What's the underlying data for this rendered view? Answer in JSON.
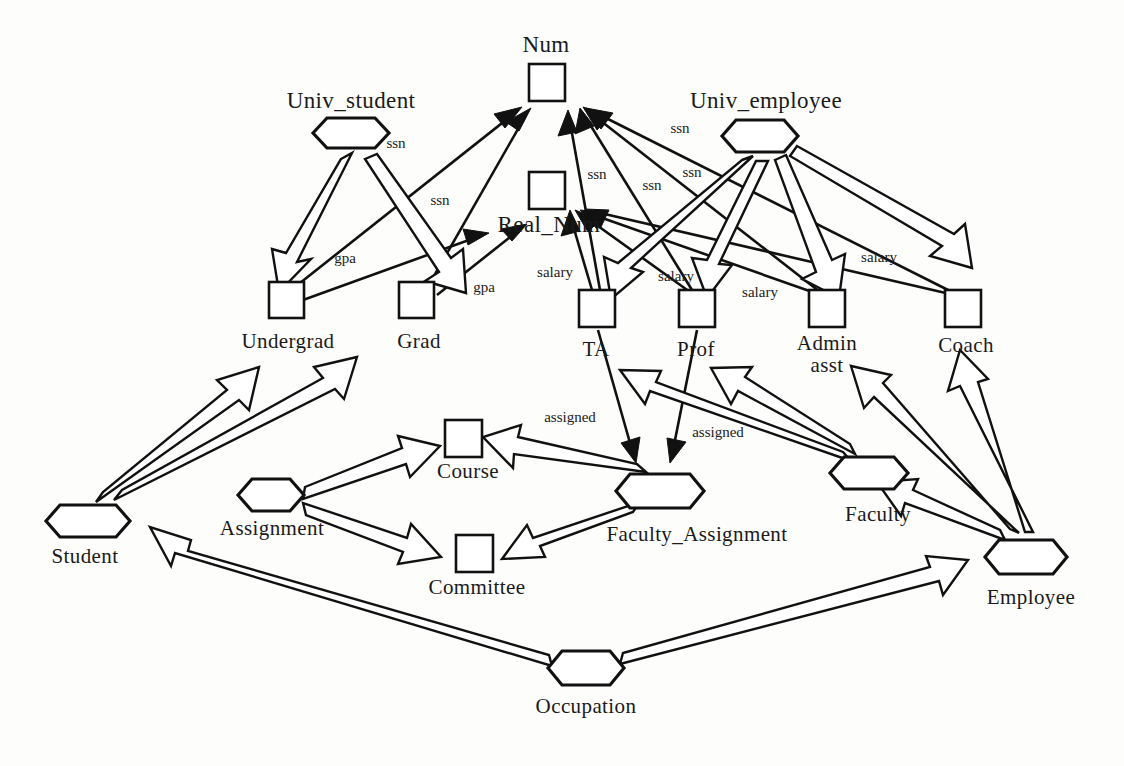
{
  "diagram": {
    "type": "entity-relationship",
    "stroke_color": "#111111",
    "background_color": "#fdfdfc"
  },
  "nodes": {
    "num": {
      "label": "Num",
      "shape": "box",
      "x": 546,
      "y": 83,
      "label_x": 546,
      "label_y": 52
    },
    "real_num": {
      "label": "Real_Num",
      "shape": "box",
      "x": 546,
      "y": 191,
      "label_x": 549,
      "label_y": 232
    },
    "univ_student": {
      "label": "Univ_student",
      "shape": "hexagon",
      "x": 351,
      "y": 133,
      "label_x": 351,
      "label_y": 108
    },
    "univ_employee": {
      "label": "Univ_employee",
      "shape": "hexagon",
      "x": 760,
      "y": 135,
      "label_x": 766,
      "label_y": 108
    },
    "undergrad": {
      "label": "Undergrad",
      "shape": "box",
      "x": 286,
      "y": 299,
      "label_x": 288,
      "label_y": 348
    },
    "grad": {
      "label": "Grad",
      "shape": "box",
      "x": 416,
      "y": 299,
      "label_x": 419,
      "label_y": 348
    },
    "ta": {
      "label": "TA",
      "shape": "box",
      "x": 597,
      "y": 308,
      "label_x": 596,
      "label_y": 356
    },
    "prof": {
      "label": "Prof",
      "shape": "box",
      "x": 697,
      "y": 308,
      "label_x": 696,
      "label_y": 356
    },
    "admin_asst": {
      "label": "Admin",
      "label2": "asst",
      "shape": "box",
      "x": 827,
      "y": 308,
      "label_x": 827,
      "label_y": 350,
      "label2_x": 827,
      "label2_y": 371
    },
    "coach": {
      "label": "Coach",
      "shape": "box",
      "x": 963,
      "y": 308,
      "label_x": 966,
      "label_y": 352
    },
    "student": {
      "label": "Student",
      "shape": "hexagon",
      "x": 88,
      "y": 521,
      "label_x": 85,
      "label_y": 563
    },
    "assignment": {
      "label": "Assignment",
      "shape": "hexagon",
      "x": 275,
      "y": 495,
      "label_x": 272,
      "label_y": 535
    },
    "course": {
      "label": "Course",
      "shape": "box",
      "x": 463,
      "y": 438,
      "label_x": 468,
      "label_y": 478
    },
    "committee": {
      "label": "Committee",
      "shape": "box",
      "x": 474,
      "y": 553,
      "label_x": 477,
      "label_y": 594
    },
    "faculty_assignment": {
      "label": "Faculty_Assignment",
      "shape": "hexagon",
      "x": 660,
      "y": 491,
      "label_x": 697,
      "label_y": 541
    },
    "faculty": {
      "label": "Faculty",
      "shape": "hexagon",
      "x": 869,
      "y": 473,
      "label_x": 878,
      "label_y": 521
    },
    "employee": {
      "label": "Employee",
      "shape": "hexagon",
      "x": 1026,
      "y": 557,
      "label_x": 1031,
      "label_y": 604
    },
    "occupation": {
      "label": "Occupation",
      "shape": "hexagon",
      "x": 586,
      "y": 668,
      "label_x": 586,
      "label_y": 713
    }
  },
  "edge_labels": [
    {
      "id": "ssn-undergrad",
      "text": "ssn",
      "x": 396,
      "y": 148
    },
    {
      "id": "ssn-grad",
      "text": "ssn",
      "x": 440,
      "y": 205
    },
    {
      "id": "ssn-ta",
      "text": "ssn",
      "x": 597,
      "y": 179
    },
    {
      "id": "ssn-prof",
      "text": "ssn",
      "x": 650,
      "y": 189
    },
    {
      "id": "ssn-admin",
      "text": "ssn",
      "x": 690,
      "y": 177
    },
    {
      "id": "ssn-coach",
      "text": "ssn",
      "x": 678,
      "y": 133
    },
    {
      "id": "gpa-undergrad",
      "text": "gpa",
      "x": 345,
      "y": 263
    },
    {
      "id": "gpa-grad",
      "text": "gpa",
      "x": 484,
      "y": 292
    },
    {
      "id": "salary-ta",
      "text": "salary",
      "x": 555,
      "y": 277
    },
    {
      "id": "salary-prof",
      "text": "salary",
      "x": 676,
      "y": 281
    },
    {
      "id": "salary-admin",
      "text": "salary",
      "x": 760,
      "y": 295
    },
    {
      "id": "salary-coach",
      "text": "salary",
      "x": 879,
      "y": 262
    },
    {
      "id": "assigned-course",
      "text": "assigned",
      "x": 570,
      "y": 422
    },
    {
      "id": "assigned-committee",
      "text": "assigned",
      "x": 716,
      "y": 437
    }
  ],
  "relationships": [
    {
      "from": "univ_student",
      "to": "undergrad",
      "kind": "hollow-arrow"
    },
    {
      "from": "univ_student",
      "to": "grad",
      "kind": "hollow-arrow"
    },
    {
      "from": "undergrad",
      "to": "num",
      "label": "ssn",
      "kind": "thin-arrow"
    },
    {
      "from": "grad",
      "to": "num",
      "label": "ssn",
      "kind": "thin-arrow"
    },
    {
      "from": "undergrad",
      "to": "real_num",
      "label": "gpa",
      "kind": "thin-arrow"
    },
    {
      "from": "grad",
      "to": "real_num",
      "label": "gpa",
      "kind": "thin-arrow"
    },
    {
      "from": "univ_employee",
      "to": "ta",
      "kind": "hollow-arrow"
    },
    {
      "from": "univ_employee",
      "to": "prof",
      "kind": "hollow-arrow"
    },
    {
      "from": "univ_employee",
      "to": "admin_asst",
      "kind": "hollow-arrow"
    },
    {
      "from": "univ_employee",
      "to": "coach",
      "kind": "hollow-arrow"
    },
    {
      "from": "ta",
      "to": "num",
      "label": "ssn",
      "kind": "thin-arrow"
    },
    {
      "from": "prof",
      "to": "num",
      "label": "ssn",
      "kind": "thin-arrow"
    },
    {
      "from": "admin_asst",
      "to": "num",
      "label": "ssn",
      "kind": "thin-arrow"
    },
    {
      "from": "coach",
      "to": "num",
      "label": "ssn",
      "kind": "thin-arrow"
    },
    {
      "from": "ta",
      "to": "real_num",
      "label": "salary",
      "kind": "thin-arrow"
    },
    {
      "from": "prof",
      "to": "real_num",
      "label": "salary",
      "kind": "thin-arrow"
    },
    {
      "from": "admin_asst",
      "to": "real_num",
      "label": "salary",
      "kind": "thin-arrow"
    },
    {
      "from": "coach",
      "to": "real_num",
      "label": "salary",
      "kind": "thin-arrow"
    },
    {
      "from": "student",
      "to": "undergrad",
      "kind": "hollow-arrow"
    },
    {
      "from": "student",
      "to": "grad",
      "kind": "hollow-arrow"
    },
    {
      "from": "assignment",
      "to": "course",
      "kind": "hollow-arrow"
    },
    {
      "from": "assignment",
      "to": "committee",
      "kind": "hollow-arrow"
    },
    {
      "from": "faculty_assignment",
      "to": "course",
      "kind": "hollow-arrow"
    },
    {
      "from": "faculty_assignment",
      "to": "committee",
      "kind": "hollow-arrow"
    },
    {
      "from": "ta",
      "to": "faculty_assignment",
      "label": "assigned",
      "kind": "thin-arrow"
    },
    {
      "from": "prof",
      "to": "faculty_assignment",
      "label": "assigned",
      "kind": "thin-arrow"
    },
    {
      "from": "faculty",
      "to": "ta",
      "kind": "hollow-arrow"
    },
    {
      "from": "faculty",
      "to": "prof",
      "kind": "hollow-arrow"
    },
    {
      "from": "employee",
      "to": "faculty",
      "kind": "hollow-arrow"
    },
    {
      "from": "employee",
      "to": "admin_asst",
      "kind": "hollow-arrow"
    },
    {
      "from": "employee",
      "to": "coach",
      "kind": "hollow-arrow"
    },
    {
      "from": "occupation",
      "to": "student",
      "kind": "hollow-arrow"
    },
    {
      "from": "occupation",
      "to": "employee",
      "kind": "hollow-arrow"
    }
  ]
}
